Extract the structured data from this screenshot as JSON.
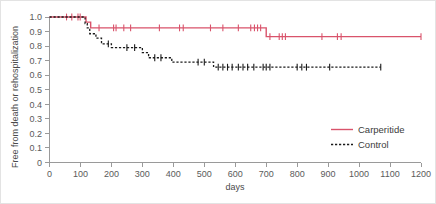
{
  "chart_data": {
    "type": "line",
    "title": "",
    "subtitle": "",
    "xlabel": "days",
    "ylabel": "Free from death or rehospitalization",
    "xlim": [
      0,
      1200
    ],
    "ylim": [
      0,
      1.0
    ],
    "grid": false,
    "legend_position": "right-middle",
    "x_ticks": [
      0,
      100,
      200,
      300,
      400,
      500,
      600,
      700,
      800,
      900,
      1000,
      1100,
      1200
    ],
    "x_tick_labels": [
      "0",
      "100",
      "200",
      "300",
      "400",
      "500",
      "600",
      "700",
      "800",
      "900",
      "1000",
      "1100",
      "1200"
    ],
    "y_ticks": [
      0,
      0.1,
      0.2,
      0.3,
      0.4,
      0.5,
      0.6,
      0.7,
      0.8,
      0.9,
      1.0
    ],
    "y_tick_labels": [
      "0",
      "0.1",
      "0.2",
      "0.3",
      "0.4",
      "0.5",
      "0.6",
      "0.7",
      "0.8",
      "0.9",
      "1.0"
    ],
    "series": [
      {
        "name": "Carperitide",
        "color": "#d9536b",
        "style": "solid",
        "steps": [
          [
            0,
            1.0
          ],
          [
            118,
            1.0
          ],
          [
            118,
            0.965
          ],
          [
            133,
            0.965
          ],
          [
            133,
            0.925
          ],
          [
            700,
            0.925
          ],
          [
            700,
            0.865
          ],
          [
            1200,
            0.865
          ]
        ],
        "censor_marks": [
          [
            55,
            1.0
          ],
          [
            72,
            1.0
          ],
          [
            92,
            1.0
          ],
          [
            99,
            1.0
          ],
          [
            160,
            0.925
          ],
          [
            207,
            0.925
          ],
          [
            215,
            0.925
          ],
          [
            240,
            0.925
          ],
          [
            262,
            0.925
          ],
          [
            355,
            0.925
          ],
          [
            420,
            0.925
          ],
          [
            432,
            0.925
          ],
          [
            520,
            0.925
          ],
          [
            560,
            0.925
          ],
          [
            610,
            0.925
          ],
          [
            650,
            0.925
          ],
          [
            662,
            0.925
          ],
          [
            672,
            0.925
          ],
          [
            682,
            0.925
          ],
          [
            712,
            0.865
          ],
          [
            742,
            0.865
          ],
          [
            752,
            0.865
          ],
          [
            762,
            0.865
          ],
          [
            880,
            0.865
          ],
          [
            930,
            0.865
          ],
          [
            942,
            0.865
          ],
          [
            1200,
            0.865
          ]
        ]
      },
      {
        "name": "Control",
        "color": "#1a1a1a",
        "style": "dashed",
        "steps": [
          [
            0,
            1.0
          ],
          [
            115,
            1.0
          ],
          [
            115,
            0.955
          ],
          [
            122,
            0.955
          ],
          [
            122,
            0.925
          ],
          [
            130,
            0.925
          ],
          [
            130,
            0.885
          ],
          [
            150,
            0.885
          ],
          [
            150,
            0.855
          ],
          [
            168,
            0.855
          ],
          [
            168,
            0.815
          ],
          [
            200,
            0.815
          ],
          [
            200,
            0.79
          ],
          [
            300,
            0.79
          ],
          [
            300,
            0.755
          ],
          [
            320,
            0.755
          ],
          [
            320,
            0.72
          ],
          [
            395,
            0.72
          ],
          [
            395,
            0.69
          ],
          [
            530,
            0.69
          ],
          [
            530,
            0.655
          ],
          [
            1070,
            0.655
          ]
        ],
        "censor_marks": [
          [
            190,
            0.815
          ],
          [
            250,
            0.79
          ],
          [
            275,
            0.79
          ],
          [
            340,
            0.72
          ],
          [
            360,
            0.72
          ],
          [
            480,
            0.69
          ],
          [
            500,
            0.69
          ],
          [
            545,
            0.655
          ],
          [
            560,
            0.655
          ],
          [
            575,
            0.655
          ],
          [
            590,
            0.655
          ],
          [
            610,
            0.655
          ],
          [
            625,
            0.655
          ],
          [
            640,
            0.655
          ],
          [
            660,
            0.655
          ],
          [
            690,
            0.655
          ],
          [
            700,
            0.655
          ],
          [
            712,
            0.655
          ],
          [
            800,
            0.655
          ],
          [
            815,
            0.655
          ],
          [
            830,
            0.655
          ],
          [
            905,
            0.655
          ],
          [
            1070,
            0.655
          ]
        ]
      }
    ]
  },
  "legend": {
    "entries": [
      {
        "label": "Carperitide"
      },
      {
        "label": "Control"
      }
    ]
  },
  "axes": {
    "x_title": "days",
    "y_title": "Free from death or rehospitalization"
  },
  "colors": {
    "carperitide": "#d9536b",
    "control": "#1a1a1a",
    "axis": "#9a9a9a",
    "text": "#4a4a4a",
    "background": "#ffffff",
    "frame": "#e3e3e3"
  }
}
